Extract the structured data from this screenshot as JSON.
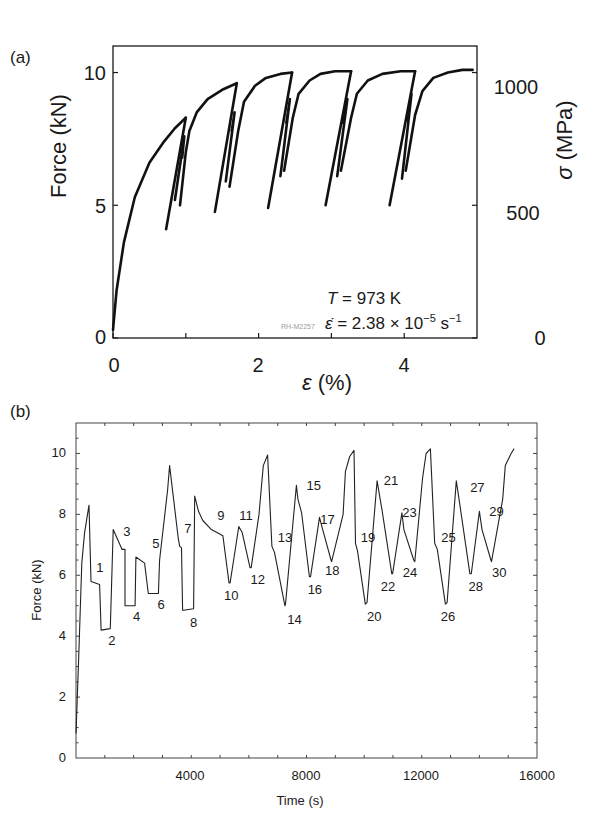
{
  "panel_a": {
    "label": "(a)",
    "ylabel_left": "Force (kN)",
    "ylabel_right_sym": "σ",
    "ylabel_right_unit": " (MPa)",
    "xlabel_sym": "ε",
    "xlabel_unit": " (%)",
    "yticks_left": [
      "0",
      "5",
      "10"
    ],
    "yticks_right": [
      "0",
      "500",
      "1000"
    ],
    "xticks": [
      "0",
      "2",
      "4"
    ],
    "annotation_T": "T = 973 K",
    "annotation_T_sym": "T",
    "annotation_T_val": " = 973 K",
    "annotation_rate_sym": "ε̇",
    "annotation_rate_val": " = 2.38 × 10",
    "annotation_rate_exp": "−5",
    "annotation_rate_unit": " s",
    "annotation_rate_unit_exp": "−1",
    "specimen_id": "RH-M2257"
  },
  "panel_b": {
    "label": "(b)",
    "ylabel": "Force (kN)",
    "xlabel": "Time (s)",
    "yticks": [
      "0",
      "2",
      "4",
      "6",
      "8",
      "10"
    ],
    "xticks": [
      "4000",
      "8000",
      "12000",
      "16000"
    ]
  },
  "chart_data": [
    {
      "type": "line",
      "title": "(a)",
      "xlabel": "ε (%)",
      "ylabel": "Force (kN)",
      "ylabel_right": "σ (MPa)",
      "xlim": [
        0,
        5.0
      ],
      "ylim": [
        0,
        11
      ],
      "ylim_right": [
        0,
        1100
      ],
      "x_ticks": [
        0,
        2,
        4
      ],
      "x_minor_ticks": [
        1,
        3
      ],
      "y_ticks": [
        0,
        5,
        10
      ],
      "y_right_ticks": [
        0,
        500,
        1000
      ],
      "grid": false,
      "annotations": [
        "T = 973 K",
        "ε̇ = 2.38 × 10^-5 s^-1",
        "RH-M2257"
      ],
      "series": [
        {
          "name": "loading 1",
          "x": [
            0.0,
            0.05,
            0.15,
            0.3,
            0.5,
            0.7,
            0.85,
            1.0
          ],
          "y": [
            0.3,
            1.8,
            3.6,
            5.3,
            6.6,
            7.4,
            7.9,
            8.3
          ]
        },
        {
          "name": "unload 1",
          "x": [
            1.0,
            0.73
          ],
          "y": [
            8.3,
            4.1
          ]
        },
        {
          "name": "reload 1a",
          "x": [
            0.85,
            0.98,
            0.95
          ],
          "y": [
            5.2,
            7.6,
            6.8
          ]
        },
        {
          "name": "reload 1b",
          "x": [
            0.92,
            1.0,
            1.05,
            1.15,
            1.3,
            1.5,
            1.7
          ],
          "y": [
            5.0,
            7.0,
            7.8,
            8.5,
            9.0,
            9.35,
            9.6
          ]
        },
        {
          "name": "unload 2",
          "x": [
            1.7,
            1.4
          ],
          "y": [
            9.6,
            4.75
          ]
        },
        {
          "name": "reload 2a",
          "x": [
            1.55,
            1.67,
            1.63
          ],
          "y": [
            5.9,
            8.5,
            7.8
          ]
        },
        {
          "name": "reload 2b",
          "x": [
            1.6,
            1.72,
            1.8,
            1.95,
            2.1,
            2.3,
            2.46
          ],
          "y": [
            5.7,
            7.8,
            8.9,
            9.5,
            9.8,
            9.95,
            10.0
          ]
        },
        {
          "name": "unload 3",
          "x": [
            2.46,
            2.13
          ],
          "y": [
            10.0,
            4.9
          ]
        },
        {
          "name": "reload 3a",
          "x": [
            2.3,
            2.43,
            2.38
          ],
          "y": [
            6.1,
            9.0,
            8.1
          ]
        },
        {
          "name": "reload 3b",
          "x": [
            2.35,
            2.47,
            2.55,
            2.7,
            2.85,
            3.05,
            3.27
          ],
          "y": [
            6.3,
            8.3,
            9.2,
            9.7,
            9.95,
            10.05,
            10.05
          ]
        },
        {
          "name": "unload 4",
          "x": [
            3.27,
            2.92
          ],
          "y": [
            10.05,
            5.0
          ]
        },
        {
          "name": "reload 4a",
          "x": [
            3.08,
            3.22,
            3.16
          ],
          "y": [
            6.1,
            9.0,
            8.1
          ]
        },
        {
          "name": "reload 4b",
          "x": [
            3.13,
            3.27,
            3.35,
            3.5,
            3.7,
            3.95,
            4.15
          ],
          "y": [
            6.3,
            8.3,
            9.2,
            9.7,
            9.95,
            10.05,
            10.05
          ]
        },
        {
          "name": "unload 5",
          "x": [
            4.15,
            3.8
          ],
          "y": [
            10.05,
            5.0
          ]
        },
        {
          "name": "reload 5a",
          "x": [
            3.97,
            4.1,
            4.04
          ],
          "y": [
            6.0,
            9.2,
            8.2
          ]
        },
        {
          "name": "reload 5b",
          "x": [
            4.02,
            4.15,
            4.25,
            4.4,
            4.6,
            4.8,
            4.94
          ],
          "y": [
            6.3,
            8.4,
            9.3,
            9.8,
            10.0,
            10.1,
            10.1
          ]
        }
      ]
    },
    {
      "type": "line",
      "title": "(b)",
      "xlabel": "Time (s)",
      "ylabel": "Force (kN)",
      "xlim": [
        0,
        16000
      ],
      "ylim": [
        0,
        11
      ],
      "x_ticks": [
        4000,
        8000,
        12000,
        16000
      ],
      "y_ticks": [
        0,
        2,
        4,
        6,
        8,
        10
      ],
      "grid": false,
      "series": [
        {
          "name": "Force history",
          "x": [
            0,
            100,
            200,
            300,
            400,
            450,
            520,
            820,
            870,
            1190,
            1290,
            1600,
            1700,
            1700,
            2050,
            2080,
            2380,
            2510,
            2860,
            2900,
            3180,
            3250,
            3550,
            3600,
            3660,
            3700,
            3730,
            4080,
            4120,
            4250,
            4400,
            4700,
            5100,
            5310,
            5350,
            5650,
            5770,
            6040,
            6080,
            6350,
            6500,
            6650,
            6800,
            6890,
            7250,
            7270,
            7650,
            7700,
            7830,
            8100,
            8140,
            8450,
            8550,
            8850,
            8870,
            9270,
            9350,
            9500,
            9650,
            9700,
            9770,
            10040,
            10100,
            10450,
            10620,
            10960,
            10990,
            11310,
            11380,
            11720,
            11760,
            12030,
            12150,
            12300,
            12450,
            12540,
            12820,
            12880,
            13200,
            13350,
            13670,
            13720,
            14000,
            14090,
            14400,
            14420,
            14810,
            14900,
            15100,
            15200,
            15210
          ],
          "y": [
            0.8,
            3.5,
            6.4,
            7.4,
            8.0,
            8.3,
            5.8,
            5.7,
            4.2,
            4.25,
            7.5,
            6.85,
            6.85,
            5.0,
            5.0,
            6.6,
            6.4,
            5.4,
            5.4,
            6.5,
            8.8,
            9.6,
            7.2,
            6.95,
            6.9,
            4.85,
            4.85,
            4.9,
            8.6,
            8.1,
            7.8,
            7.5,
            7.3,
            5.75,
            5.75,
            7.6,
            7.4,
            6.25,
            6.25,
            8.0,
            9.6,
            9.95,
            6.95,
            6.75,
            5.0,
            5.05,
            8.95,
            8.5,
            8.05,
            5.95,
            5.95,
            7.9,
            7.55,
            6.5,
            6.45,
            8.0,
            9.4,
            9.9,
            10.1,
            7.05,
            6.8,
            5.05,
            5.1,
            9.1,
            8.15,
            6.05,
            6.05,
            8.05,
            7.5,
            6.5,
            6.45,
            9.2,
            10.0,
            10.15,
            7.05,
            6.85,
            5.05,
            5.1,
            9.1,
            8.15,
            6.05,
            6.05,
            8.1,
            7.5,
            6.5,
            6.45,
            8.5,
            9.6,
            10.0,
            10.15,
            10.15
          ]
        }
      ],
      "segment_labels": [
        {
          "n": "1",
          "x": 700,
          "y": 6.1
        },
        {
          "n": "2",
          "x": 1120,
          "y": 3.7
        },
        {
          "n": "3",
          "x": 1640,
          "y": 7.3
        },
        {
          "n": "4",
          "x": 1980,
          "y": 4.5
        },
        {
          "n": "5",
          "x": 2650,
          "y": 6.9
        },
        {
          "n": "6",
          "x": 2830,
          "y": 4.9
        },
        {
          "n": "7",
          "x": 3760,
          "y": 7.4
        },
        {
          "n": "8",
          "x": 3960,
          "y": 4.3
        },
        {
          "n": "9",
          "x": 4900,
          "y": 7.8
        },
        {
          "n": "10",
          "x": 5140,
          "y": 5.2
        },
        {
          "n": "11",
          "x": 5670,
          "y": 7.8
        },
        {
          "n": "12",
          "x": 6060,
          "y": 5.7
        },
        {
          "n": "13",
          "x": 7000,
          "y": 7.1
        },
        {
          "n": "14",
          "x": 7330,
          "y": 4.4
        },
        {
          "n": "15",
          "x": 8000,
          "y": 8.8
        },
        {
          "n": "16",
          "x": 8040,
          "y": 5.4
        },
        {
          "n": "17",
          "x": 8480,
          "y": 7.7
        },
        {
          "n": "18",
          "x": 8640,
          "y": 6.0
        },
        {
          "n": "19",
          "x": 9880,
          "y": 7.1
        },
        {
          "n": "20",
          "x": 10100,
          "y": 4.5
        },
        {
          "n": "21",
          "x": 10680,
          "y": 8.95
        },
        {
          "n": "22",
          "x": 10580,
          "y": 5.5
        },
        {
          "n": "23",
          "x": 11320,
          "y": 7.9
        },
        {
          "n": "24",
          "x": 11340,
          "y": 5.95
        },
        {
          "n": "25",
          "x": 12680,
          "y": 7.1
        },
        {
          "n": "26",
          "x": 12660,
          "y": 4.5
        },
        {
          "n": "27",
          "x": 13680,
          "y": 8.75
        },
        {
          "n": "28",
          "x": 13620,
          "y": 5.5
        },
        {
          "n": "29",
          "x": 14340,
          "y": 7.95
        },
        {
          "n": "30",
          "x": 14440,
          "y": 5.95
        }
      ]
    }
  ]
}
